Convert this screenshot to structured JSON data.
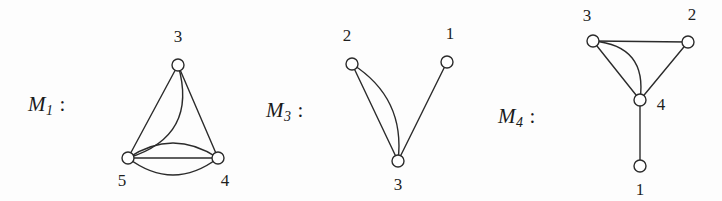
{
  "figure": {
    "background_color": "#fdfdfd",
    "stroke_color": "#2b2b2b",
    "node_fill_color": "#ffffff",
    "node_radius": 6,
    "stroke_width": 1.4,
    "width": 722,
    "height": 201
  },
  "graphs": [
    {
      "id": "M1",
      "label_main": "M",
      "label_sub": "1",
      "label_colon": ":",
      "label_x": 28,
      "label_y": 92,
      "nodes": [
        {
          "name": "3",
          "x": 178,
          "y": 65,
          "label_x": 178,
          "label_y": 37
        },
        {
          "name": "5",
          "x": 128,
          "y": 158,
          "label_x": 122,
          "label_y": 181
        },
        {
          "name": "4",
          "x": 218,
          "y": 158,
          "label_x": 225,
          "label_y": 181
        }
      ],
      "edges": [
        {
          "from": "3",
          "to": "5",
          "curve": -26,
          "style": "curved"
        },
        {
          "from": "3",
          "to": "5",
          "curve": 0,
          "style": "straight"
        },
        {
          "from": "3",
          "to": "4",
          "curve": 0,
          "style": "straight"
        },
        {
          "from": "5",
          "to": "4",
          "curve": -15,
          "style": "curved"
        },
        {
          "from": "5",
          "to": "4",
          "curve": 0,
          "style": "straight"
        },
        {
          "from": "5",
          "to": "4",
          "curve": 17,
          "style": "curved"
        }
      ]
    },
    {
      "id": "M3",
      "label_main": "M",
      "label_sub": "3",
      "label_colon": ":",
      "label_x": 266,
      "label_y": 98,
      "nodes": [
        {
          "name": "2",
          "x": 352,
          "y": 64,
          "label_x": 347,
          "label_y": 36
        },
        {
          "name": "1",
          "x": 447,
          "y": 62,
          "label_x": 450,
          "label_y": 34
        },
        {
          "name": "3",
          "x": 398,
          "y": 161,
          "label_x": 398,
          "label_y": 185
        }
      ],
      "edges": [
        {
          "from": "2",
          "to": "3",
          "curve": -17,
          "style": "curved"
        },
        {
          "from": "2",
          "to": "3",
          "curve": 0,
          "style": "straight"
        },
        {
          "from": "1",
          "to": "3",
          "curve": 0,
          "style": "straight"
        }
      ]
    },
    {
      "id": "M4",
      "label_main": "M",
      "label_sub": "4",
      "label_colon": ":",
      "label_x": 498,
      "label_y": 104,
      "nodes": [
        {
          "name": "3",
          "x": 593,
          "y": 41,
          "label_x": 587,
          "label_y": 16
        },
        {
          "name": "2",
          "x": 688,
          "y": 42,
          "label_x": 692,
          "label_y": 15
        },
        {
          "name": "4",
          "x": 640,
          "y": 100,
          "label_x": 661,
          "label_y": 105
        },
        {
          "name": "1",
          "x": 640,
          "y": 166,
          "label_x": 640,
          "label_y": 190
        }
      ],
      "edges": [
        {
          "from": "3",
          "to": "2",
          "curve": 0,
          "style": "straight"
        },
        {
          "from": "2",
          "to": "4",
          "curve": 0,
          "style": "straight"
        },
        {
          "from": "3",
          "to": "4",
          "curve": -20,
          "style": "curved"
        },
        {
          "from": "3",
          "to": "4",
          "curve": 0,
          "style": "straight"
        },
        {
          "from": "4",
          "to": "1",
          "curve": 0,
          "style": "straight"
        }
      ]
    }
  ]
}
